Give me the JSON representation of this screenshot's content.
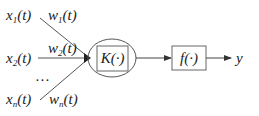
{
  "diagram": {
    "inputs": [
      {
        "x_base": "x",
        "x_sub": "1",
        "x_arg": "(t)",
        "w_base": "w",
        "w_sub": "1",
        "w_arg": "(t)"
      },
      {
        "x_base": "x",
        "x_sub": "2",
        "x_arg": "(t)",
        "w_base": "w",
        "w_sub": "2",
        "w_arg": "(t)"
      },
      {
        "x_base": "x",
        "x_sub": "n",
        "x_arg": "(t)",
        "w_base": "w",
        "w_sub": "n",
        "w_arg": "(t)"
      }
    ],
    "ellipsis": "…",
    "kernel_block": {
      "label": "K(·)"
    },
    "activation_block": {
      "label": "f(·)"
    },
    "output": {
      "label": "y"
    },
    "colors": {
      "line": "#444444",
      "stroke": "#555555",
      "text": "#222222"
    }
  }
}
